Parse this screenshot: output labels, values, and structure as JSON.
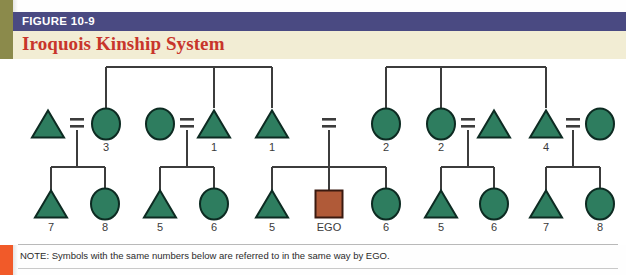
{
  "figure": {
    "label": "FIGURE 10-9",
    "title": "Iroquois Kinship System",
    "note": "NOTE: Symbols with the same numbers below are referred to in the same way by EGO.",
    "label_bar_color": "#4a4a82",
    "title_bar_color": "#f2edd4",
    "title_color": "#c8352b",
    "edge_olive_color": "#8b8a4b",
    "edge_orange_color": "#f15a29"
  },
  "palette": {
    "symbol_fill": "#2e7d5f",
    "symbol_stroke": "#0d2b22",
    "ego_fill": "#b05a38",
    "ego_stroke": "#3a1a10",
    "line_color": "#3c3c3c"
  },
  "chart_data": {
    "type": "diagram",
    "diagram_kind": "kinship-chart",
    "title": "Iroquois Kinship System",
    "legend": {
      "triangle": "male",
      "circle": "female",
      "square": "EGO (reference person)",
      "equals": "marriage / union",
      "vertical-line": "descent",
      "horizontal-bar": "sibling set"
    },
    "rows": {
      "grandparent_y": 8,
      "parent_y": 65,
      "child_y": 145
    },
    "parent_generation": [
      {
        "id": "p1",
        "shape": "triangle",
        "x": 48,
        "label": "",
        "sex": "male"
      },
      {
        "id": "p2",
        "shape": "circle",
        "x": 106,
        "label": "3",
        "sex": "female"
      },
      {
        "id": "p3",
        "shape": "circle",
        "x": 160,
        "label": "",
        "sex": "female"
      },
      {
        "id": "p4",
        "shape": "triangle",
        "x": 214,
        "label": "1",
        "sex": "male"
      },
      {
        "id": "p5",
        "shape": "triangle",
        "x": 272,
        "label": "1",
        "sex": "male"
      },
      {
        "id": "p6",
        "shape": "circle",
        "x": 386,
        "label": "2",
        "sex": "female"
      },
      {
        "id": "p7",
        "shape": "circle",
        "x": 441,
        "label": "2",
        "sex": "female"
      },
      {
        "id": "p8",
        "shape": "triangle",
        "x": 494,
        "label": "",
        "sex": "male"
      },
      {
        "id": "p9",
        "shape": "triangle",
        "x": 546,
        "label": "4",
        "sex": "male"
      },
      {
        "id": "p10",
        "shape": "circle",
        "x": 600,
        "label": "",
        "sex": "female"
      }
    ],
    "marriages": [
      {
        "id": "m1",
        "x": 77,
        "left": "p1",
        "right": "p2",
        "children_bar": true
      },
      {
        "id": "m2",
        "x": 187,
        "left": "p3",
        "right": "p4",
        "children_bar": true
      },
      {
        "id": "m3",
        "x": 329,
        "left": "",
        "right": "",
        "children_bar": true
      },
      {
        "id": "m4",
        "x": 468,
        "left": "p7",
        "right": "p8",
        "children_bar": true
      },
      {
        "id": "m5",
        "x": 573,
        "left": "p9",
        "right": "p10",
        "children_bar": true
      }
    ],
    "child_generation": [
      {
        "id": "c1",
        "shape": "triangle",
        "x": 51,
        "label": "7",
        "parent_marriage": "m1"
      },
      {
        "id": "c2",
        "shape": "circle",
        "x": 105,
        "label": "8",
        "parent_marriage": "m1"
      },
      {
        "id": "c3",
        "shape": "triangle",
        "x": 160,
        "label": "5",
        "parent_marriage": "m2"
      },
      {
        "id": "c4",
        "shape": "circle",
        "x": 214,
        "label": "6",
        "parent_marriage": "m2"
      },
      {
        "id": "c5",
        "shape": "triangle",
        "x": 272,
        "label": "5",
        "parent_marriage": "m3"
      },
      {
        "id": "c6",
        "shape": "square",
        "x": 329,
        "label": "EGO",
        "parent_marriage": "m3",
        "is_ego": true
      },
      {
        "id": "c7",
        "shape": "circle",
        "x": 386,
        "label": "6",
        "parent_marriage": "m3"
      },
      {
        "id": "c8",
        "shape": "triangle",
        "x": 441,
        "label": "5",
        "parent_marriage": "m4"
      },
      {
        "id": "c9",
        "shape": "circle",
        "x": 494,
        "label": "6",
        "parent_marriage": "m4"
      },
      {
        "id": "c10",
        "shape": "triangle",
        "x": 546,
        "label": "7",
        "parent_marriage": "m5"
      },
      {
        "id": "c11",
        "shape": "circle",
        "x": 600,
        "label": "8",
        "parent_marriage": "m5"
      }
    ],
    "sibling_sets": [
      {
        "id": "s1",
        "bar_y": 8,
        "drop_top": 0,
        "members": [
          "p2",
          "p4",
          "p5"
        ]
      },
      {
        "id": "s2",
        "bar_y": 8,
        "drop_top": 0,
        "members": [
          "p6",
          "p7",
          "p9"
        ]
      }
    ]
  }
}
